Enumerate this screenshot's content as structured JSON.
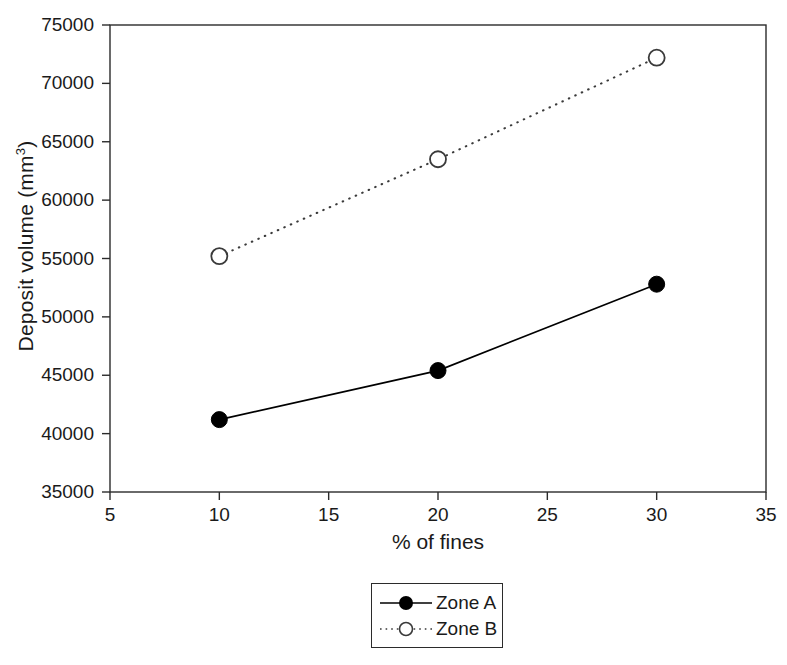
{
  "chart_data": {
    "type": "line",
    "title": "",
    "xlabel": "% of fines",
    "ylabel": "Deposit volume (mm3)",
    "ylabel_base": "Deposit volume (mm",
    "ylabel_sup": "3",
    "ylabel_tail": ")",
    "x": [
      10,
      20,
      30
    ],
    "xlim": [
      5,
      35
    ],
    "ylim": [
      35000,
      75000
    ],
    "xticks": [
      5,
      10,
      15,
      20,
      25,
      30,
      35
    ],
    "xtick_labels": [
      "5",
      "10",
      "15",
      "20",
      "25",
      "30",
      "35"
    ],
    "yticks": [
      35000,
      40000,
      45000,
      50000,
      55000,
      60000,
      65000,
      70000,
      75000
    ],
    "ytick_labels": [
      "35000",
      "40000",
      "45000",
      "50000",
      "55000",
      "60000",
      "65000",
      "70000",
      "75000"
    ],
    "grid": false,
    "legend_position": "below-center",
    "series": [
      {
        "name": "Zone A",
        "values": [
          41200,
          45400,
          52800
        ],
        "line_style": "solid",
        "marker": "filled-circle",
        "color": "#000000"
      },
      {
        "name": "Zone B",
        "values": [
          55200,
          63500,
          72200
        ],
        "line_style": "dotted",
        "marker": "open-circle",
        "color": "#3a3a3a"
      }
    ]
  },
  "legend": {
    "entries": [
      {
        "label": "Zone A"
      },
      {
        "label": "Zone B"
      }
    ]
  },
  "colors": {
    "axis": "#2b2b2b",
    "series_a": "#000000",
    "series_b": "#3a3a3a",
    "background": "#ffffff"
  }
}
